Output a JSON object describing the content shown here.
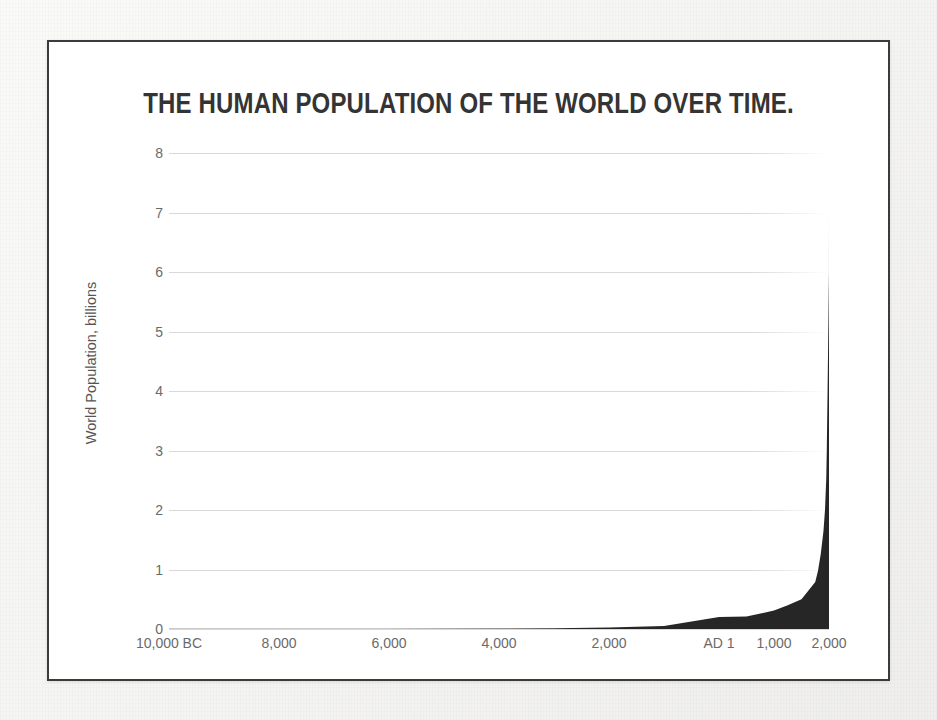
{
  "figure": {
    "title": "THE HUMAN POPULATION OF THE WORLD OVER TIME.",
    "frame_color": "#3b3b3b",
    "page_background": "#f5f5f4",
    "plot_background": "#ffffff"
  },
  "chart_data": {
    "type": "area",
    "title": "THE HUMAN POPULATION OF THE WORLD OVER TIME.",
    "xlabel": "",
    "ylabel": "World Population, billions",
    "series_name": "World Population",
    "fill_color": "#262626",
    "grid": true,
    "grid_color": "#d9d9d9",
    "legend": "none",
    "xlim": [
      -10000,
      2000
    ],
    "ylim": [
      0,
      8
    ],
    "x_tick_labels": [
      "10,000 BC",
      "8,000",
      "6,000",
      "4,000",
      "2,000",
      "AD 1",
      "1,000",
      "2,000"
    ],
    "x_tick_values": [
      -10000,
      -8000,
      -6000,
      -4000,
      -2000,
      1,
      1000,
      2000
    ],
    "y_tick_labels": [
      "0",
      "1",
      "2",
      "3",
      "4",
      "5",
      "6",
      "7",
      "8"
    ],
    "y_tick_values": [
      0,
      1,
      2,
      3,
      4,
      5,
      6,
      7,
      8
    ],
    "x": [
      -10000,
      -8000,
      -6000,
      -4000,
      -3000,
      -2000,
      -1000,
      1,
      500,
      1000,
      1250,
      1500,
      1750,
      1800,
      1850,
      1900,
      1927,
      1950,
      1960,
      1975,
      1987,
      1999,
      2000
    ],
    "values": [
      0.004,
      0.005,
      0.006,
      0.007,
      0.014,
      0.027,
      0.05,
      0.2,
      0.21,
      0.31,
      0.4,
      0.5,
      0.79,
      0.98,
      1.26,
      1.65,
      2.0,
      2.52,
      3.02,
      4.07,
      5.0,
      6.0,
      7.0
    ],
    "peak_value": 7.0,
    "peak_label": "2,000"
  }
}
